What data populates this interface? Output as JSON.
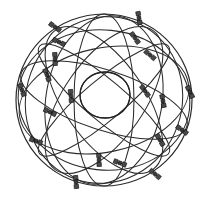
{
  "figure": {
    "background_color": "#ffffff",
    "line_color": "#2b2b2b",
    "satellite_color": "#3a3a3a",
    "canvas": {
      "width": 209,
      "height": 201
    }
  },
  "globe": {
    "label": "sphere-outline",
    "center_x": 104,
    "center_y": 100,
    "radius_x": 88,
    "radius_y": 86
  },
  "core": {
    "label": "central-circle",
    "center_x": 105,
    "center_y": 95,
    "radius_x": 25,
    "radius_y": 23
  },
  "chart_data": {
    "type": "scatter",
    "xlabel": "",
    "ylabel": "",
    "grid": false,
    "legend": "none",
    "xlim": [
      0,
      209
    ],
    "ylim": [
      0,
      201
    ],
    "orbits": [
      {
        "name": "orbit-outer-sphere",
        "cx": 104,
        "cy": 100,
        "rx": 88,
        "ry": 86,
        "rotation": 0
      },
      {
        "name": "orbit-meridian-a",
        "cx": 104,
        "cy": 100,
        "rx": 30,
        "ry": 86,
        "rotation": 0
      },
      {
        "name": "orbit-meridian-b",
        "cx": 104,
        "cy": 100,
        "rx": 58,
        "ry": 85,
        "rotation": 10
      },
      {
        "name": "orbit-meridian-c",
        "cx": 104,
        "cy": 100,
        "rx": 78,
        "ry": 84,
        "rotation": 20
      },
      {
        "name": "orbit-equator-tilt-1",
        "cx": 104,
        "cy": 100,
        "rx": 87,
        "ry": 30,
        "rotation": 18
      },
      {
        "name": "orbit-equator-tilt-2",
        "cx": 104,
        "cy": 100,
        "rx": 86,
        "ry": 52,
        "rotation": -12
      },
      {
        "name": "orbit-equator-tilt-3",
        "cx": 104,
        "cy": 100,
        "rx": 86,
        "ry": 70,
        "rotation": 6
      },
      {
        "name": "orbit-inclined-1",
        "cx": 104,
        "cy": 100,
        "rx": 85,
        "ry": 40,
        "rotation": 55
      },
      {
        "name": "orbit-inclined-2",
        "cx": 104,
        "cy": 100,
        "rx": 85,
        "ry": 40,
        "rotation": -55
      },
      {
        "name": "orbit-inclined-3",
        "cx": 104,
        "cy": 100,
        "rx": 84,
        "ry": 20,
        "rotation": 40
      },
      {
        "name": "orbit-inclined-4",
        "cx": 104,
        "cy": 100,
        "rx": 84,
        "ry": 20,
        "rotation": -40
      },
      {
        "name": "orbit-core-ring",
        "cx": 105,
        "cy": 95,
        "rx": 25,
        "ry": 23,
        "rotation": 0
      }
    ],
    "satellites": [
      {
        "id": 1,
        "x": 55,
        "y": 27,
        "angle": 35
      },
      {
        "id": 2,
        "x": 139,
        "y": 18,
        "angle": 80
      },
      {
        "id": 3,
        "x": 59,
        "y": 42,
        "angle": 25
      },
      {
        "id": 4,
        "x": 135,
        "y": 38,
        "angle": 55
      },
      {
        "id": 5,
        "x": 55,
        "y": 59,
        "angle": 88
      },
      {
        "id": 6,
        "x": 150,
        "y": 55,
        "angle": 40
      },
      {
        "id": 7,
        "x": 22,
        "y": 90,
        "angle": 70
      },
      {
        "id": 8,
        "x": 71,
        "y": 96,
        "angle": 85
      },
      {
        "id": 9,
        "x": 145,
        "y": 91,
        "angle": 55
      },
      {
        "id": 10,
        "x": 163,
        "y": 101,
        "angle": 80
      },
      {
        "id": 11,
        "x": 190,
        "y": 92,
        "angle": 65
      },
      {
        "id": 12,
        "x": 50,
        "y": 112,
        "angle": 25
      },
      {
        "id": 13,
        "x": 36,
        "y": 141,
        "angle": 20
      },
      {
        "id": 14,
        "x": 182,
        "y": 130,
        "angle": 35
      },
      {
        "id": 15,
        "x": 99,
        "y": 160,
        "angle": 88
      },
      {
        "id": 16,
        "x": 120,
        "y": 163,
        "angle": 20
      },
      {
        "id": 17,
        "x": 76,
        "y": 182,
        "angle": 85
      },
      {
        "id": 18,
        "x": 155,
        "y": 174,
        "angle": 40
      },
      {
        "id": 19,
        "x": 160,
        "y": 140,
        "angle": 60
      },
      {
        "id": 20,
        "x": 47,
        "y": 75,
        "angle": 70
      }
    ]
  }
}
